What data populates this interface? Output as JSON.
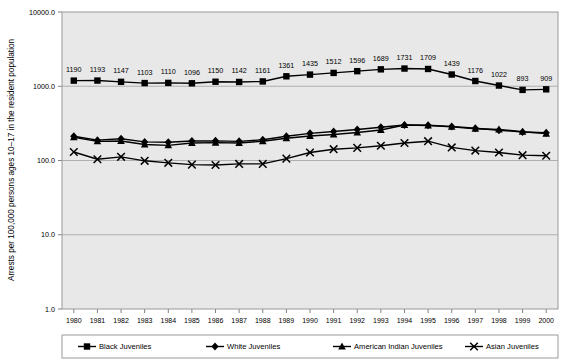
{
  "chart_data": {
    "type": "line",
    "title": "",
    "xlabel": "",
    "ylabel": "Arrests per 100,000 persons ages 10–17 in the resident population",
    "yscale": "log",
    "ylim": [
      1.0,
      10000.0
    ],
    "ytick_labels": [
      "10000.0",
      "1000.0",
      "100.0",
      "10.0",
      "1.0"
    ],
    "ytick_values": [
      10000.0,
      1000.0,
      100.0,
      10.0,
      1.0
    ],
    "grid": true,
    "legend_position": "bottom",
    "x": [
      1980,
      1981,
      1982,
      1983,
      1984,
      1985,
      1986,
      1987,
      1988,
      1989,
      1990,
      1991,
      1992,
      1993,
      1994,
      1995,
      1996,
      1997,
      1998,
      1999,
      2000
    ],
    "categories": [
      "1980",
      "1981",
      "1982",
      "1983",
      "1984",
      "1985",
      "1986",
      "1987",
      "1988",
      "1989",
      "1990",
      "1991",
      "1992",
      "1993",
      "1994",
      "1995",
      "1996",
      "1997",
      "1998",
      "1999",
      "2000"
    ],
    "series": [
      {
        "name": "Black Juveniles",
        "marker": "square",
        "labeled": true,
        "values": [
          1190,
          1193,
          1147,
          1103,
          1110,
          1096,
          1150,
          1142,
          1161,
          1361,
          1435,
          1512,
          1596,
          1689,
          1731,
          1709,
          1439,
          1176,
          1022,
          893,
          909
        ],
        "data_labels": [
          "1190",
          "1193",
          "1147",
          "1103",
          "1110",
          "1096",
          "1150",
          "1142",
          "1161",
          "1361",
          "1435",
          "1512",
          "1596",
          "1689",
          "1731",
          "1709",
          "1439",
          "1176",
          "1022",
          "893",
          "909"
        ]
      },
      {
        "name": "White Juveniles",
        "marker": "diamond",
        "labeled": false,
        "values": [
          212,
          188,
          196,
          178,
          176,
          183,
          184,
          181,
          190,
          212,
          232,
          246,
          262,
          280,
          300,
          298,
          288,
          272,
          256,
          242,
          236
        ]
      },
      {
        "name": "American Indian Juveniles",
        "marker": "triangle",
        "labeled": false,
        "values": [
          206,
          181,
          183,
          164,
          160,
          172,
          174,
          172,
          182,
          199,
          214,
          224,
          238,
          258,
          300,
          296,
          284,
          268,
          262,
          244,
          230
        ]
      },
      {
        "name": "Asian Juveniles",
        "marker": "x",
        "labeled": false,
        "values": [
          130,
          104,
          112,
          99,
          93,
          88,
          87,
          90,
          90,
          106,
          128,
          142,
          148,
          158,
          172,
          182,
          150,
          136,
          128,
          118,
          116
        ]
      }
    ]
  },
  "legend": {
    "entries": [
      {
        "label": "Black Juveniles",
        "marker": "square"
      },
      {
        "label": "White Juveniles",
        "marker": "diamond"
      },
      {
        "label": "American Indian Juveniles",
        "marker": "triangle"
      },
      {
        "label": "Asian Juveniles",
        "marker": "x"
      }
    ]
  },
  "colors": {
    "series": "#000000",
    "plot_background": "#e8e8e8",
    "page_background": "#ffffff",
    "gridline": "#a8a8a8",
    "axis": "#808080"
  }
}
